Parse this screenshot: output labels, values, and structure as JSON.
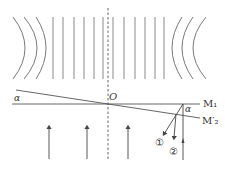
{
  "diagram": {
    "colors": {
      "line": "#555555",
      "fringe": "#777777",
      "text": "#333333",
      "background": "#ffffff"
    },
    "fringes": {
      "left_arcs": [
        {
          "end_x": 13,
          "mid_x": 25
        },
        {
          "end_x": 24,
          "mid_x": 37
        },
        {
          "end_x": 36,
          "mid_x": 46
        }
      ],
      "straight_x": [
        53,
        63,
        74,
        84,
        94,
        103,
        113,
        124,
        135,
        145,
        155,
        164
      ],
      "right_arcs": [
        {
          "end_x": 182,
          "mid_x": 172
        },
        {
          "end_x": 193,
          "mid_x": 182
        },
        {
          "end_x": 206,
          "mid_x": 193
        }
      ],
      "top_y": 17,
      "bottom_y": 79
    },
    "labels": {
      "alpha_left": "α",
      "origin": "O",
      "alpha_right": "α",
      "mirror1": "M₁",
      "mirror2_prime": "M′₂",
      "ray1": "①",
      "ray2": "②"
    },
    "incident_arrows_x": [
      49,
      87,
      128
    ]
  }
}
